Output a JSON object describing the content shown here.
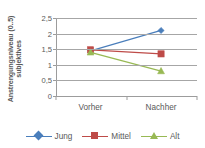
{
  "chart_data": {
    "type": "line",
    "title": "",
    "xlabel": "",
    "ylabel_line1": "subjektives",
    "ylabel_line2": "Anstrengungsniveau (0..5)",
    "categories": [
      "Vorher",
      "Nachher"
    ],
    "ylim": [
      0,
      2.5
    ],
    "ytick_values": [
      2.5,
      2,
      1.5,
      1,
      0.5,
      0
    ],
    "ytick_labels": [
      "2,5",
      "2",
      "1,5",
      "1",
      "0,5",
      "0"
    ],
    "grid": "horizontal",
    "legend_position": "bottom",
    "series": [
      {
        "name": "Jung",
        "values": [
          1.45,
          2.1
        ],
        "color": "#4a7ebb",
        "marker": "diamond"
      },
      {
        "name": "Mittel",
        "values": [
          1.48,
          1.35
        ],
        "color": "#be4b48",
        "marker": "square"
      },
      {
        "name": "Alt",
        "values": [
          1.4,
          0.8
        ],
        "color": "#98b954",
        "marker": "triangle"
      }
    ]
  },
  "axis": {
    "gridline_color": "#a6a6a6",
    "axis_color": "#9c9c9c",
    "text_color": "#595959"
  }
}
